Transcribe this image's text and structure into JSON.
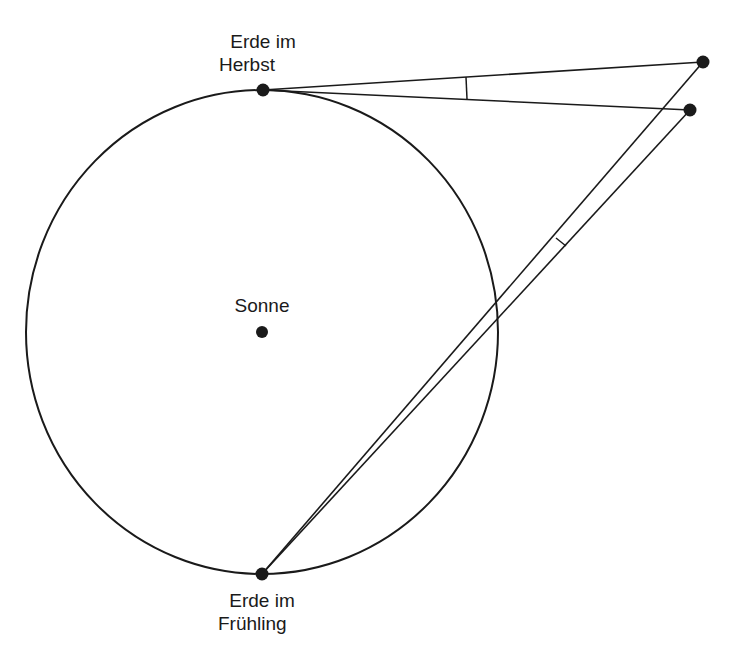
{
  "labels": {
    "autumn_line1": "Erde im",
    "autumn_line2": "Herbst",
    "sun": "Sonne",
    "spring_line1": "Erde im",
    "spring_line2": "Frühling"
  },
  "geometry": {
    "orbit": {
      "cx": 262,
      "cy": 332,
      "rx": 236,
      "ry": 242
    },
    "sun": {
      "x": 262,
      "y": 332
    },
    "earth_autumn": {
      "x": 263,
      "y": 90
    },
    "earth_spring": {
      "x": 262,
      "y": 574
    },
    "star_far": {
      "x": 703,
      "y": 62
    },
    "star_near": {
      "x": 690,
      "y": 110
    }
  },
  "colors": {
    "ink": "#1a1a1a",
    "background": "#ffffff"
  }
}
